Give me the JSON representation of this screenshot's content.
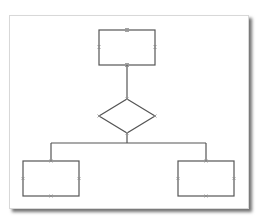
{
  "diagram": {
    "type": "flowchart",
    "colors": {
      "stroke": "#555555",
      "marker": "#8a8a8a",
      "panel_bg": "#ffffff"
    },
    "nodes": [
      {
        "id": "top-box",
        "shape": "rectangle",
        "x": 99,
        "y": 30,
        "w": 56,
        "h": 35,
        "label": ""
      },
      {
        "id": "decision",
        "shape": "diamond",
        "cx": 127,
        "cy": 116,
        "rx": 28,
        "ry": 17,
        "label": ""
      },
      {
        "id": "left-box",
        "shape": "rectangle",
        "x": 23,
        "y": 161,
        "w": 56,
        "h": 35,
        "label": ""
      },
      {
        "id": "right-box",
        "shape": "rectangle",
        "x": 178,
        "y": 161,
        "w": 56,
        "h": 35,
        "label": ""
      }
    ],
    "edges": [
      {
        "from": "top-box",
        "to": "decision"
      },
      {
        "from": "decision",
        "to": "left-box"
      },
      {
        "from": "decision",
        "to": "right-box"
      }
    ]
  }
}
